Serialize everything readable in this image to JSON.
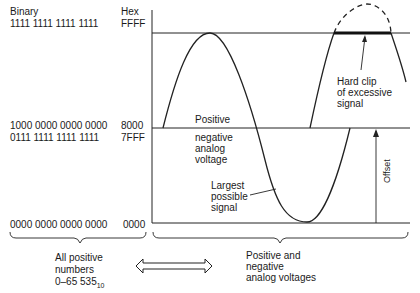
{
  "headers": {
    "binary": "Binary",
    "hex": "Hex"
  },
  "levels": [
    {
      "binary": "1111 1111 1111 1111",
      "hex": "FFFF"
    },
    {
      "binary": "1000 0000 0000 0000",
      "hex": "8000"
    },
    {
      "binary": "0111 1111 1111 1111",
      "hex": "7FFF"
    },
    {
      "binary": "0000 0000 0000 0000",
      "hex": "0000"
    }
  ],
  "annotations": {
    "positive": "Positive",
    "negative_analog_voltage": "negative\nanalog\nvoltage",
    "largest_possible_signal": "Largest\npossible\nsignal",
    "hard_clip": "Hard clip\nof excessive\nsignal",
    "offset": "Offset"
  },
  "bottom": {
    "left_label_line1": "All positive",
    "left_label_line2": "numbers",
    "left_label_line3": "0–65 535",
    "left_label_subscript": "10",
    "right_label": "Positive and\nnegative\nanalog voltages"
  }
}
